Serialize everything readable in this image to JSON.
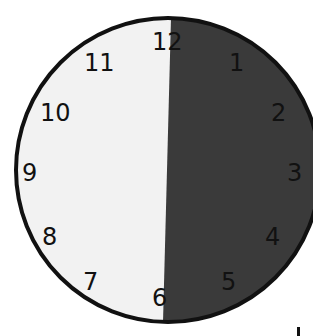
{
  "clock": {
    "center": {
      "x": 169,
      "y": 170
    },
    "radius": 152,
    "colors": {
      "shaded_half": "#3a3a3a",
      "unshaded_half": "#f2f2f2",
      "rim": "#111111"
    },
    "shaded_region": {
      "from": "12",
      "to": "6",
      "side": "right"
    },
    "numerals": {
      "n12": "12",
      "n1": "1",
      "n2": "2",
      "n3": "3",
      "n4": "4",
      "n5": "5",
      "n6": "6",
      "n7": "7",
      "n8": "8",
      "n9": "9",
      "n10": "10",
      "n11": "11"
    }
  }
}
